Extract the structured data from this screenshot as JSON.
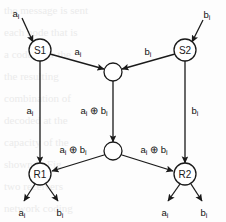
{
  "figure": {
    "background_color": "#fdfdfd",
    "stroke_color": "#1a1a1a",
    "node_fill": "#ffffff"
  },
  "symbols": {
    "a": "a",
    "b": "b",
    "subscript": "i",
    "xor": "⊕"
  },
  "nodes": [
    {
      "id": "S1",
      "label": "S1",
      "role": "source",
      "cx": 40,
      "cy": 50,
      "r": 11
    },
    {
      "id": "S2",
      "label": "S2",
      "role": "source",
      "cx": 185,
      "cy": 50,
      "r": 11
    },
    {
      "id": "X1",
      "label": "",
      "role": "xor-junction",
      "cx": 113,
      "cy": 72,
      "r": 9
    },
    {
      "id": "X2",
      "label": "",
      "role": "xor-junction",
      "cx": 113,
      "cy": 151,
      "r": 9
    },
    {
      "id": "R1",
      "label": "R1",
      "role": "receiver",
      "cx": 40,
      "cy": 174,
      "r": 11
    },
    {
      "id": "R2",
      "label": "R2",
      "role": "receiver",
      "cx": 185,
      "cy": 174,
      "r": 11
    }
  ],
  "input_labels": [
    {
      "id": "input-a-left",
      "text": "a",
      "sub": "i",
      "x": 16,
      "y": 13
    },
    {
      "id": "input-b-right",
      "text": "b",
      "sub": "i",
      "x": 207,
      "y": 14
    }
  ],
  "output_labels": [
    {
      "id": "output-r1-a",
      "text": "a",
      "sub": "i",
      "x": 22,
      "y": 212
    },
    {
      "id": "output-r1-b",
      "text": "b",
      "sub": "i",
      "x": 60,
      "y": 212
    },
    {
      "id": "output-r2-a",
      "text": "a",
      "sub": "i",
      "x": 165,
      "y": 212
    },
    {
      "id": "output-r2-b",
      "text": "b",
      "sub": "i",
      "x": 204,
      "y": 212
    }
  ],
  "edge_labels": [
    {
      "id": "edge-s1-x1",
      "kind": "plain",
      "text": "a",
      "sub": "i",
      "x": 78,
      "y": 51
    },
    {
      "id": "edge-s2-x1",
      "kind": "plain",
      "text": "b",
      "sub": "i",
      "x": 148,
      "y": 51
    },
    {
      "id": "edge-s1-r1",
      "kind": "plain",
      "text": "a",
      "sub": "i",
      "x": 30,
      "y": 110
    },
    {
      "id": "edge-s2-r2",
      "kind": "plain",
      "text": "b",
      "sub": "i",
      "x": 195,
      "y": 110
    },
    {
      "id": "edge-x1-x2",
      "kind": "xor",
      "left": "a",
      "right": "b",
      "sub": "i",
      "x": 94,
      "y": 110
    },
    {
      "id": "edge-x2-r1",
      "kind": "xor",
      "left": "a",
      "right": "b",
      "sub": "i",
      "x": 73,
      "y": 149
    },
    {
      "id": "edge-x2-r2",
      "kind": "xor",
      "left": "a",
      "right": "b",
      "sub": "i",
      "x": 154,
      "y": 149
    }
  ],
  "edges": [
    {
      "id": "in-a-to-s1",
      "from": "input-a",
      "to": "S1",
      "type": "arrow",
      "d": "M 22,18 L 33,42"
    },
    {
      "id": "in-b-to-s2",
      "from": "input-b",
      "to": "S2",
      "type": "arrow",
      "d": "M 203,20 L 192,42"
    },
    {
      "id": "s1-to-x1",
      "from": "S1",
      "to": "X1",
      "type": "arrow",
      "d": "M 50,54 L 104,69"
    },
    {
      "id": "s2-to-x1",
      "from": "S2",
      "to": "X1",
      "type": "arrow",
      "d": "M 175,54 L 122,69"
    },
    {
      "id": "s1-to-r1",
      "from": "S1",
      "to": "R1",
      "type": "arrow",
      "d": "M 40,61 L 40,163"
    },
    {
      "id": "s2-to-r2",
      "from": "S2",
      "to": "R2",
      "type": "arrow",
      "d": "M 185,61 L 185,163"
    },
    {
      "id": "x1-to-x2",
      "from": "X1",
      "to": "X2",
      "type": "arrow",
      "d": "M 113,81 L 113,142"
    },
    {
      "id": "x2-to-r1",
      "from": "X2",
      "to": "R1",
      "type": "arrow",
      "d": "M 104,155 L 52,171"
    },
    {
      "id": "x2-to-r2",
      "from": "X2",
      "to": "R2",
      "type": "arrow",
      "d": "M 122,155 L 173,171"
    },
    {
      "id": "r1-out-a",
      "from": "R1",
      "to": "output-r1-a",
      "type": "arrow",
      "d": "M 35,184 L 24,201"
    },
    {
      "id": "r1-out-b",
      "from": "R1",
      "to": "output-r1-b",
      "type": "arrow",
      "d": "M 46,184 L 58,201"
    },
    {
      "id": "r2-out-a",
      "from": "R2",
      "to": "output-r2-a",
      "type": "arrow",
      "d": "M 180,184 L 168,201"
    },
    {
      "id": "r2-out-b",
      "from": "R2",
      "to": "output-r2-b",
      "type": "arrow",
      "d": "M 191,184 L 202,201"
    }
  ],
  "background_bleed": [
    {
      "x": 4,
      "y": 10,
      "text": "the message is sent"
    },
    {
      "x": 4,
      "y": 32,
      "text": "each node that is"
    },
    {
      "x": 4,
      "y": 54,
      "text": "a code over the"
    },
    {
      "x": 4,
      "y": 76,
      "text": "the resulting"
    },
    {
      "x": 4,
      "y": 98,
      "text": "combination of"
    },
    {
      "x": 4,
      "y": 120,
      "text": "decoded at the"
    },
    {
      "x": 4,
      "y": 142,
      "text": "capacity of the"
    },
    {
      "x": 4,
      "y": 164,
      "text": "shown in Fig."
    },
    {
      "x": 4,
      "y": 186,
      "text": "two receivers"
    },
    {
      "x": 4,
      "y": 208,
      "text": "network coding"
    }
  ]
}
